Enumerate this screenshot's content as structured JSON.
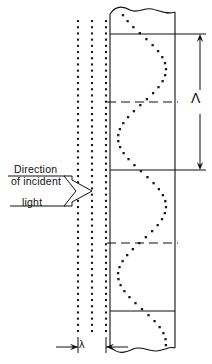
{
  "figure": {
    "labels": {
      "direction_line1": "Direction",
      "direction_line2": "of  incident",
      "light": "light",
      "grating_period_symbol": "Λ",
      "wavelength_symbol": "λ"
    },
    "icons": {
      "incident_arrow": "double-line-hollow-arrow-icon",
      "period_dimension": "vertical-double-arrow-icon",
      "wavelength_dimension": "horizontal-inward-arrow-icon"
    },
    "colors": {
      "ink": "#111111",
      "background": "#ffffff",
      "dot": "#1a1a1a"
    }
  },
  "geometry": {
    "medium_rect": {
      "x": 110,
      "y": 22,
      "width": 65,
      "height": 318
    },
    "wavefronts": {
      "count": 3,
      "x_positions": [
        78,
        92,
        106
      ],
      "y_top": 20,
      "y_bottom": 336,
      "dot_spacing": 6.2,
      "dot_size": 2.1
    },
    "solid_fringe_lines_y": [
      34,
      170,
      311
    ],
    "dashed_fringe_lines_y": [
      102,
      243
    ],
    "sine_curve": {
      "amplitude": 24,
      "center_x": 142,
      "period": 137,
      "phase_y": 34,
      "y_start": 14,
      "y_end": 348,
      "dot_spacing": 6,
      "dot_size": 2.3
    },
    "period_dimension": {
      "x": 200,
      "y_top": 34,
      "y_bottom": 170
    },
    "wavelength_dimension": {
      "x_left": 78,
      "x_right": 106,
      "y": 347
    }
  },
  "chart_data": {
    "type": "line",
    "xlabel": "lateral displacement",
    "ylabel": "depth",
    "series": [
      {
        "name": "fringe-profile",
        "description": "dotted sinusoid of spatial period Λ",
        "amplitude": 24,
        "period": 137
      }
    ],
    "annotations": [
      {
        "symbol": "Λ",
        "meaning": "grating period (fringe spacing)"
      },
      {
        "symbol": "λ",
        "meaning": "wavelength of incident light"
      }
    ],
    "grid": false,
    "legend": "none"
  }
}
